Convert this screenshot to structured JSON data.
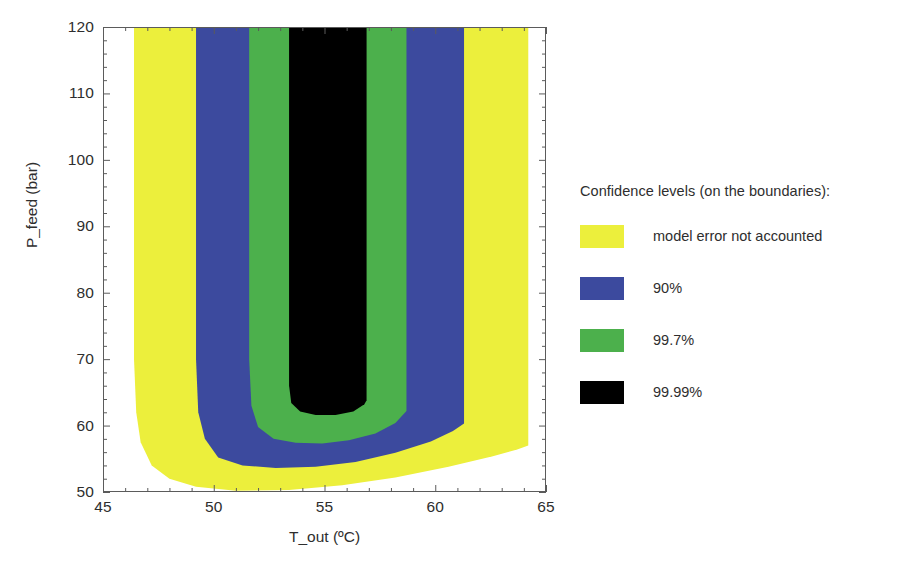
{
  "chart_data": {
    "type": "area",
    "title": "",
    "subtitle": "",
    "xlabel": "T_out (ºC)",
    "ylabel": "P_feed (bar)",
    "xlim": [
      45,
      65
    ],
    "ylim": [
      50,
      120
    ],
    "xticks": [
      45,
      50,
      55,
      60,
      65
    ],
    "yticks": [
      50,
      60,
      70,
      80,
      90,
      100,
      110,
      120
    ],
    "xtick_labels": [
      "45",
      "50",
      "55",
      "60",
      "65"
    ],
    "ytick_labels": [
      "50",
      "60",
      "70",
      "80",
      "90",
      "100",
      "110",
      "120"
    ],
    "x_minor_tick_step": 1,
    "y_minor_tick_step": 2,
    "grid": false,
    "legend_position": "right",
    "plot_background": "#ffffff",
    "frame_color": "#5b5b5b",
    "regions": [
      {
        "name": "model error not accounted",
        "color": "#ecef3c",
        "level": "model error not accounted",
        "top_left_x": 46.4,
        "top_right_x": 64.2,
        "bottom_left_y": 50.2,
        "bottom_right_y": 57.0,
        "boundary_x_left": [
          46.4,
          46.4,
          46.5,
          46.7,
          47.2,
          48.0,
          49.2,
          51.0,
          53.4,
          55.8,
          58.2,
          60.6,
          62.6,
          63.7,
          64.2,
          64.2
        ],
        "boundary_y": [
          120.0,
          70.0,
          62.0,
          57.5,
          54.0,
          52.0,
          50.8,
          50.2,
          50.3,
          51.0,
          52.2,
          53.8,
          55.4,
          56.4,
          57.0,
          120.0
        ]
      },
      {
        "name": "90%",
        "color": "#3c4a9e",
        "level": "90%",
        "top_left_x": 49.2,
        "top_right_x": 61.3,
        "bottom_left_y": 53.6,
        "bottom_right_y": 60.3,
        "boundary_x_left": [
          49.2,
          49.2,
          49.3,
          49.6,
          50.2,
          51.3,
          52.8,
          54.6,
          56.4,
          58.2,
          59.8,
          60.8,
          61.3,
          61.3
        ],
        "boundary_y": [
          120.0,
          70.0,
          62.0,
          58.0,
          55.2,
          54.0,
          53.6,
          53.8,
          54.5,
          55.9,
          57.6,
          59.2,
          60.3,
          120.0
        ]
      },
      {
        "name": "99.7%",
        "color": "#4cb04c",
        "level": "99.7%",
        "top_left_x": 51.6,
        "top_right_x": 58.7,
        "bottom_left_y": 57.3,
        "bottom_right_y": 62.2,
        "boundary_x_left": [
          51.6,
          51.6,
          51.7,
          52.0,
          52.7,
          53.7,
          54.9,
          56.1,
          57.3,
          58.2,
          58.7,
          58.7
        ],
        "boundary_y": [
          120.0,
          70.0,
          63.0,
          59.8,
          58.0,
          57.4,
          57.3,
          57.8,
          58.8,
          60.4,
          62.2,
          120.0
        ]
      },
      {
        "name": "99.99%",
        "color": "#000000",
        "level": "99.99%",
        "top_left_x": 53.4,
        "top_right_x": 56.9,
        "bottom_left_y": 61.5,
        "bottom_right_y": 63.8,
        "boundary_x_left": [
          53.4,
          53.4,
          53.5,
          53.9,
          54.6,
          55.5,
          56.3,
          56.8,
          56.9,
          56.9
        ],
        "boundary_y": [
          120.0,
          66.0,
          63.4,
          62.1,
          61.6,
          61.6,
          62.1,
          63.2,
          63.8,
          120.0
        ]
      }
    ]
  },
  "axes": {
    "y": {
      "title": "P_feed (bar)",
      "ticks": [
        {
          "value": 120,
          "label": "120"
        },
        {
          "value": 110,
          "label": "110"
        },
        {
          "value": 100,
          "label": "100"
        },
        {
          "value": 90,
          "label": "90"
        },
        {
          "value": 80,
          "label": "80"
        },
        {
          "value": 70,
          "label": "70"
        },
        {
          "value": 60,
          "label": "60"
        },
        {
          "value": 50,
          "label": "50"
        }
      ]
    },
    "x": {
      "title": "T_out (ºC)",
      "ticks": [
        {
          "value": 45,
          "label": "45"
        },
        {
          "value": 50,
          "label": "50"
        },
        {
          "value": 55,
          "label": "55"
        },
        {
          "value": 60,
          "label": "60"
        },
        {
          "value": 65,
          "label": "65"
        }
      ]
    }
  },
  "legend": {
    "title": "Confidence levels (on the boundaries):",
    "items": [
      {
        "label": "model error not accounted",
        "color": "#ecef3c",
        "swatch_name": "legend-swatch-yellow"
      },
      {
        "label": "90%",
        "color": "#3c4a9e",
        "swatch_name": "legend-swatch-blue"
      },
      {
        "label": "99.7%",
        "color": "#4cb04c",
        "swatch_name": "legend-swatch-green"
      },
      {
        "label": "99.99%",
        "color": "#000000",
        "swatch_name": "legend-swatch-black"
      }
    ]
  }
}
